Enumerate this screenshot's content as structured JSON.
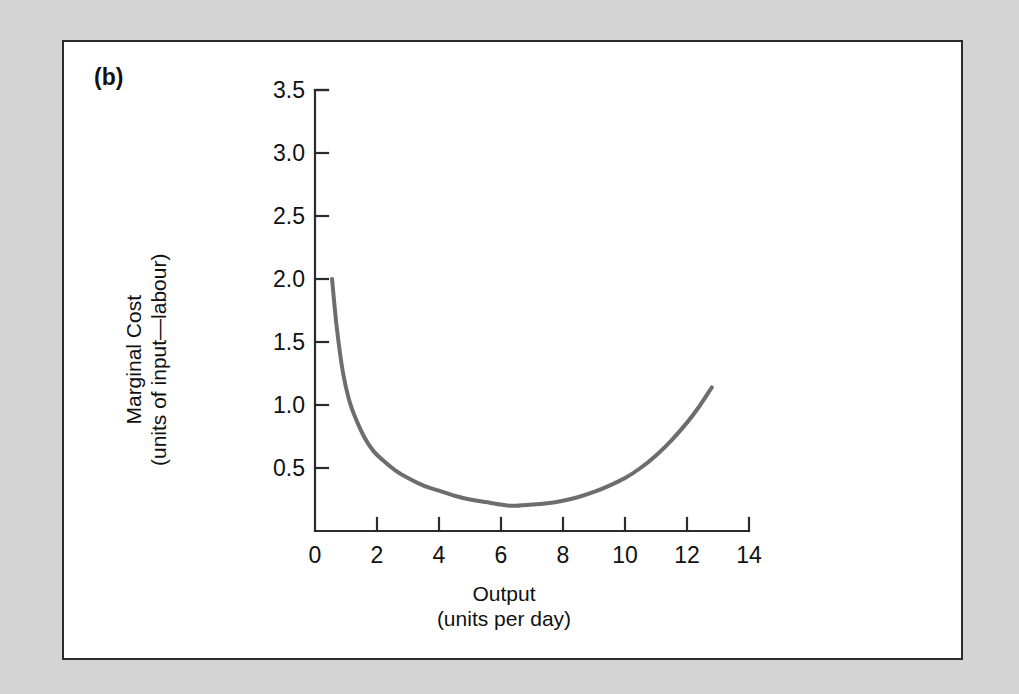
{
  "figure": {
    "panel_label": "(b)",
    "background_color": "#d4d4d4",
    "panel_color": "#ffffff",
    "border_color": "#2b2b2b"
  },
  "chart_data": {
    "type": "line",
    "title": "",
    "subtitle": "",
    "xlabel": "Output",
    "xlabel_units": "(units per day)",
    "ylabel": "Marginal Cost",
    "ylabel_units": "(units of input—labour)",
    "xlim": [
      0,
      14
    ],
    "ylim": [
      0,
      3.5
    ],
    "x_ticks": [
      0,
      2,
      4,
      6,
      8,
      10,
      12,
      14
    ],
    "x_tick_labels": [
      "0",
      "2",
      "4",
      "6",
      "8",
      "10",
      "12",
      "14"
    ],
    "y_ticks": [
      0.5,
      1.0,
      1.5,
      2.0,
      2.5,
      3.0,
      3.5
    ],
    "y_tick_labels": [
      "0.5",
      "1.0",
      "1.5",
      "2.0",
      "2.5",
      "3.0",
      "3.5"
    ],
    "grid": false,
    "legend": false,
    "series": [
      {
        "name": "Marginal cost",
        "color": "#6d6d6d",
        "line_width": 4,
        "x": [
          0.55,
          0.7,
          0.9,
          1.1,
          1.3,
          1.6,
          1.9,
          2.2,
          2.6,
          3.0,
          3.5,
          4.0,
          4.5,
          5.0,
          5.5,
          6.0,
          6.4,
          7.0,
          7.5,
          8.0,
          8.5,
          9.0,
          9.5,
          10.0,
          10.5,
          11.0,
          11.5,
          12.0,
          12.4,
          12.8
        ],
        "y": [
          2.0,
          1.62,
          1.26,
          1.04,
          0.9,
          0.74,
          0.63,
          0.56,
          0.48,
          0.42,
          0.36,
          0.32,
          0.28,
          0.25,
          0.23,
          0.21,
          0.2,
          0.21,
          0.22,
          0.24,
          0.27,
          0.31,
          0.36,
          0.42,
          0.5,
          0.6,
          0.72,
          0.86,
          0.99,
          1.14
        ]
      }
    ],
    "annotations": [
      {
        "text": "(b)",
        "x_px": 95,
        "y_px": 78
      }
    ]
  }
}
